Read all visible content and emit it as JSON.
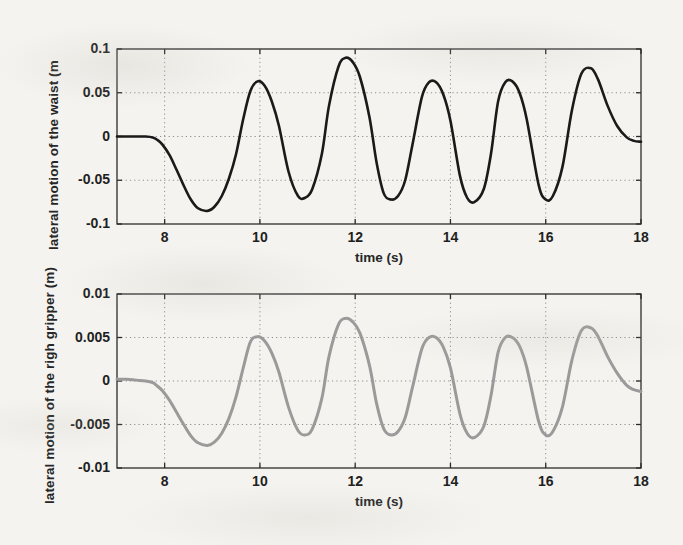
{
  "figure": {
    "background_color": "#f4f3ef",
    "panel_count": 2
  },
  "chart_data": [
    {
      "id": "waist",
      "type": "line",
      "title": "",
      "xlabel": "time (s)",
      "ylabel": "lateral motion of the waist (m",
      "xlim": [
        7,
        18
      ],
      "ylim": [
        -0.1,
        0.1
      ],
      "xticks": [
        8,
        10,
        12,
        14,
        16,
        18
      ],
      "xticklabels": [
        "8",
        "10",
        "12",
        "14",
        "16",
        "18"
      ],
      "yticks": [
        0.1,
        0.05,
        0,
        -0.05,
        -0.1
      ],
      "yticklabels": [
        "0.1",
        "0.05",
        "0",
        "-0.05",
        "-0.1"
      ],
      "grid": "dotted",
      "legend": "none",
      "line_color": "#1a1a1a",
      "line_width": 2.6,
      "series": [
        {
          "name": "lateral motion of the waist",
          "x": [
            7.0,
            7.2,
            7.4,
            7.6,
            7.75,
            7.85,
            7.95,
            8.1,
            8.25,
            8.4,
            8.55,
            8.7,
            8.9,
            9.05,
            9.2,
            9.35,
            9.5,
            9.65,
            9.8,
            9.95,
            10.1,
            10.25,
            10.4,
            10.6,
            10.8,
            10.95,
            11.1,
            11.3,
            11.45,
            11.65,
            11.8,
            11.95,
            12.1,
            12.3,
            12.45,
            12.6,
            12.75,
            12.9,
            13.05,
            13.2,
            13.4,
            13.55,
            13.7,
            13.85,
            14.0,
            14.2,
            14.35,
            14.5,
            14.7,
            14.85,
            15.0,
            15.15,
            15.3,
            15.45,
            15.6,
            15.85,
            16.0,
            16.15,
            16.35,
            16.55,
            16.75,
            16.95,
            17.1,
            17.3,
            17.5,
            17.7,
            17.85,
            18.0
          ],
          "y": [
            0.0,
            0.0,
            0.0,
            0.0,
            -0.001,
            -0.004,
            -0.009,
            -0.021,
            -0.038,
            -0.056,
            -0.072,
            -0.082,
            -0.085,
            -0.08,
            -0.068,
            -0.048,
            -0.02,
            0.02,
            0.052,
            0.063,
            0.058,
            0.04,
            0.012,
            -0.04,
            -0.068,
            -0.07,
            -0.06,
            -0.02,
            0.035,
            0.08,
            0.09,
            0.085,
            0.068,
            0.022,
            -0.03,
            -0.065,
            -0.072,
            -0.068,
            -0.05,
            -0.01,
            0.045,
            0.062,
            0.062,
            0.048,
            0.018,
            -0.045,
            -0.07,
            -0.075,
            -0.06,
            -0.02,
            0.04,
            0.062,
            0.063,
            0.05,
            0.02,
            -0.055,
            -0.072,
            -0.068,
            -0.035,
            0.03,
            0.072,
            0.078,
            0.065,
            0.035,
            0.012,
            -0.001,
            -0.005,
            -0.006
          ]
        }
      ]
    },
    {
      "id": "gripper",
      "type": "line",
      "title": "",
      "xlabel": "time (s)",
      "ylabel": "lateral motion of the righ gripper (m)",
      "xlim": [
        7,
        18
      ],
      "ylim": [
        -0.01,
        0.01
      ],
      "xticks": [
        8,
        10,
        12,
        14,
        16,
        18
      ],
      "xticklabels": [
        "8",
        "10",
        "12",
        "14",
        "16",
        "18"
      ],
      "yticks": [
        0.01,
        0.005,
        0,
        -0.005,
        -0.01
      ],
      "yticklabels": [
        "0.01",
        "0.005",
        "0",
        "-0.005",
        "-0.01"
      ],
      "grid": "dotted",
      "legend": "none",
      "line_color": "#9a9a9a",
      "line_width": 3.0,
      "series": [
        {
          "name": "lateral motion of the righ gripper",
          "x": [
            7.0,
            7.2,
            7.4,
            7.6,
            7.75,
            7.85,
            7.95,
            8.1,
            8.25,
            8.4,
            8.55,
            8.7,
            8.9,
            9.05,
            9.2,
            9.35,
            9.5,
            9.65,
            9.8,
            9.95,
            10.1,
            10.25,
            10.4,
            10.6,
            10.8,
            10.95,
            11.1,
            11.3,
            11.45,
            11.65,
            11.8,
            11.95,
            12.1,
            12.3,
            12.45,
            12.6,
            12.75,
            12.9,
            13.05,
            13.2,
            13.4,
            13.55,
            13.7,
            13.85,
            14.0,
            14.2,
            14.35,
            14.5,
            14.7,
            14.85,
            15.0,
            15.15,
            15.3,
            15.45,
            15.6,
            15.85,
            16.0,
            16.15,
            16.35,
            16.55,
            16.75,
            16.95,
            17.1,
            17.3,
            17.5,
            17.7,
            17.85,
            18.0
          ],
          "y": [
            0.0002,
            0.0002,
            0.0001,
            0.0,
            -0.0002,
            -0.0006,
            -0.0011,
            -0.0022,
            -0.0036,
            -0.005,
            -0.0063,
            -0.0071,
            -0.0074,
            -0.007,
            -0.006,
            -0.0043,
            -0.0018,
            0.0015,
            0.0045,
            0.0051,
            0.0046,
            0.0032,
            0.001,
            -0.003,
            -0.0057,
            -0.0062,
            -0.0055,
            -0.002,
            0.0028,
            0.0065,
            0.0072,
            0.0068,
            0.0055,
            0.0018,
            -0.0026,
            -0.0055,
            -0.0062,
            -0.0058,
            -0.0042,
            -0.0008,
            0.0037,
            0.005,
            0.005,
            0.0039,
            0.0015,
            -0.0038,
            -0.006,
            -0.0065,
            -0.0052,
            -0.0017,
            0.0033,
            0.005,
            0.005,
            0.004,
            0.0016,
            -0.0046,
            -0.0062,
            -0.0058,
            -0.003,
            0.0024,
            0.0058,
            0.0061,
            0.0051,
            0.0028,
            0.0009,
            -0.0005,
            -0.001,
            -0.0012
          ]
        }
      ]
    }
  ]
}
